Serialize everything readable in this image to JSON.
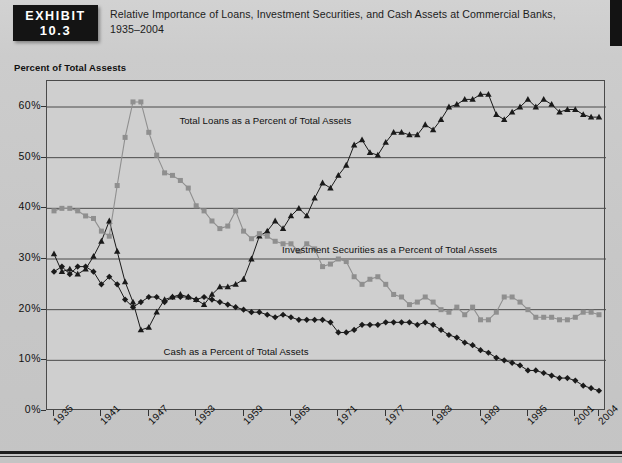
{
  "header": {
    "badge_line1": "EXHIBIT",
    "badge_line2": "10.3",
    "title_line1": "Relative Importance of Loans, Investment Securities, and Cash Assets at Commercial Banks,",
    "title_line2": "1935–2004"
  },
  "axis_caption": "Percent of Total Assests",
  "colors": {
    "loans": "#1a1a1a",
    "securities": "#8f8f8f",
    "cash": "#1a1a1a",
    "plot_background": "#cfcfcf",
    "grid": "#4a4a4a",
    "page_background": "#c9c9c9",
    "badge_background": "#141414"
  },
  "chart_data": {
    "type": "line",
    "title": "Relative Importance of Loans, Investment Securities, and Cash Assets at Commercial Banks, 1935–2004",
    "xlabel": "",
    "ylabel": "Percent of Total Assests",
    "ylim": [
      0,
      65
    ],
    "xlim": [
      1935,
      2004
    ],
    "grid": true,
    "legend": "annotations-inline",
    "ytick_labels": [
      "0%",
      "10%",
      "20%",
      "30%",
      "40%",
      "50%",
      "60%"
    ],
    "ytick_values": [
      0,
      10,
      20,
      30,
      40,
      50,
      60
    ],
    "xtick_labels": [
      "1935",
      "1941",
      "1947",
      "1953",
      "1959",
      "1965",
      "1971",
      "1977",
      "1983",
      "1989",
      "1995",
      "2001",
      "2004"
    ],
    "xtick_values": [
      1935,
      1941,
      1947,
      1953,
      1959,
      1965,
      1971,
      1977,
      1983,
      1989,
      1995,
      2001,
      2004
    ],
    "annotations": [
      {
        "text": "Total Loans as a Percent of Total Assets",
        "x": 1951,
        "y": 57
      },
      {
        "text": "Investment Securities as a Percent of Total Assets",
        "x": 1964,
        "y": 31.5
      },
      {
        "text": "Cash as a Percent of Total Assets",
        "x": 1949,
        "y": 11.5
      }
    ],
    "x": [
      1935,
      1936,
      1937,
      1938,
      1939,
      1940,
      1941,
      1942,
      1943,
      1944,
      1945,
      1946,
      1947,
      1948,
      1949,
      1950,
      1951,
      1952,
      1953,
      1954,
      1955,
      1956,
      1957,
      1958,
      1959,
      1960,
      1961,
      1962,
      1963,
      1964,
      1965,
      1966,
      1967,
      1968,
      1969,
      1970,
      1971,
      1972,
      1973,
      1974,
      1975,
      1976,
      1977,
      1978,
      1979,
      1980,
      1981,
      1982,
      1983,
      1984,
      1985,
      1986,
      1987,
      1988,
      1989,
      1990,
      1991,
      1992,
      1993,
      1994,
      1995,
      1996,
      1997,
      1998,
      1999,
      2000,
      2001,
      2002,
      2003,
      2004
    ],
    "series": [
      {
        "name": "Total Loans as a Percent of Total Assets",
        "marker": "triangle",
        "color": "#1a1a1a",
        "values": [
          31,
          27.5,
          28,
          27,
          28,
          30.5,
          33.5,
          37.5,
          31.5,
          25.5,
          21.5,
          16,
          16.5,
          19.5,
          22,
          22.5,
          23,
          22.5,
          22,
          21,
          23,
          24.5,
          24.5,
          25,
          26,
          30,
          34.5,
          35.5,
          37.5,
          36,
          38.5,
          40,
          38.5,
          42,
          45,
          44,
          46.5,
          48.5,
          52.5,
          53.5,
          51,
          50.5,
          53,
          55,
          55,
          54.5,
          54.5,
          56.5,
          55.5,
          57.5,
          60,
          60.5,
          61.5,
          61.5,
          62.5,
          62.5,
          58.5,
          57.5,
          59,
          60,
          61.5,
          60,
          61.5,
          60.5,
          59,
          59.5,
          59.5,
          58.5,
          58,
          58
        ]
      },
      {
        "name": "Investment Securities as a Percent of Total Assets",
        "marker": "square",
        "color": "#8f8f8f",
        "values": [
          39.5,
          40,
          40,
          39.5,
          38.5,
          38,
          35.5,
          34.5,
          44.5,
          54,
          61,
          61,
          55,
          50.5,
          47,
          46.5,
          45.5,
          44,
          40.5,
          39.5,
          37.5,
          36,
          36.5,
          39.5,
          35.5,
          34,
          35,
          34.5,
          33.5,
          33,
          33,
          31.5,
          33,
          32,
          28.5,
          29,
          30,
          29.5,
          26.5,
          25,
          26,
          26.5,
          25,
          23,
          22.5,
          21,
          21.5,
          22.5,
          21.5,
          20,
          19.5,
          20.5,
          19,
          20.5,
          18,
          18,
          19.5,
          22.5,
          22.5,
          21.5,
          20,
          18.5,
          18.5,
          18.5,
          18,
          18,
          18.5,
          19.5,
          19.5,
          19
        ]
      },
      {
        "name": "Cash as a Percent of Total Assets",
        "marker": "diamond",
        "color": "#1a1a1a",
        "values": [
          27.5,
          28.5,
          27,
          28.5,
          28.5,
          27.5,
          25,
          26.5,
          25,
          22,
          20.5,
          21.5,
          22.5,
          22.5,
          21.5,
          22.5,
          22.5,
          22.5,
          22,
          22.5,
          22,
          21.5,
          21,
          20.5,
          20,
          19.5,
          19.5,
          19,
          18.5,
          19,
          18.5,
          18,
          18,
          18,
          18,
          17.5,
          15.5,
          15.5,
          16,
          17,
          17,
          17,
          17.5,
          17.5,
          17.5,
          17.5,
          17,
          17.5,
          17,
          16,
          15,
          14.5,
          13.5,
          13,
          12,
          11.5,
          10.5,
          10,
          9.5,
          9,
          8,
          8,
          7.5,
          7,
          6.5,
          6.5,
          6,
          5,
          4.5,
          4
        ]
      }
    ]
  }
}
